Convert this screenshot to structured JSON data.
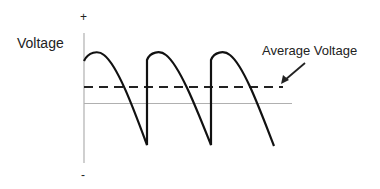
{
  "diagram": {
    "y_axis_label": "Voltage",
    "plus_sign": "+",
    "minus_sign": "-",
    "annotation": "Average Voltage",
    "colors": {
      "waveform": "#111111",
      "average_line": "#222222",
      "axis": "#b0b0b0",
      "arrow": "#222222"
    }
  }
}
